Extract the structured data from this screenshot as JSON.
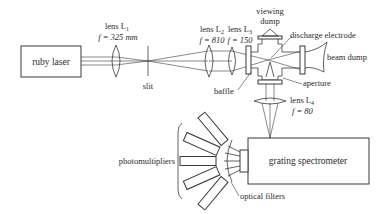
{
  "diagram": {
    "type": "optical-setup",
    "components": {
      "ruby_laser": "ruby laser",
      "lens_l1": {
        "name": "lens L",
        "sub": "1",
        "focal": "f = 325 mm"
      },
      "slit": "slit",
      "lens_l2": {
        "name": "lens L",
        "sub": "2",
        "focal": "f = 810"
      },
      "lens_l3": {
        "name": "lens L",
        "sub": "3",
        "focal": "f = 150"
      },
      "viewing_dump": [
        "viewing",
        "dump"
      ],
      "discharge_electrode": "discharge electrode",
      "beam_dump": "beam dump",
      "aperture": "aperture",
      "baffle": "baffle",
      "lens_l4": {
        "name": "lens L",
        "sub": "4",
        "focal": "f = 80"
      },
      "grating_spectrometer": "grating spectrometer",
      "photomultipliers": "photomultipliers",
      "optical_filters": "optical filters"
    },
    "photomultiplier_count": 5
  }
}
